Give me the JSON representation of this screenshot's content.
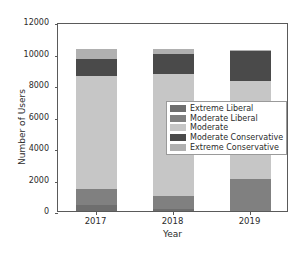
{
  "chart_data": {
    "type": "bar",
    "subtype": "stacked-vertical",
    "title": "",
    "xlabel": "Year",
    "ylabel": "Number of Users",
    "categories": [
      "2017",
      "2018",
      "2019"
    ],
    "xtick_labels": [
      "2017",
      "2018",
      "2019"
    ],
    "ytick_labels": [
      "0",
      "2000",
      "4000",
      "6000",
      "8000",
      "10000",
      "12000"
    ],
    "ytick_values": [
      0,
      2000,
      4000,
      6000,
      8000,
      10000,
      12000
    ],
    "ylim": [
      0,
      12000
    ],
    "grid": false,
    "legend_position": "center-right",
    "series": [
      {
        "name": "Extreme Liberal",
        "color": "#6e6e6e",
        "values": [
          400,
          100,
          0
        ]
      },
      {
        "name": "Moderate Liberal",
        "color": "#808080",
        "values": [
          1000,
          850,
          2050
        ]
      },
      {
        "name": "Moderate",
        "color": "#c6c6c6",
        "values": [
          7150,
          7750,
          6200
        ]
      },
      {
        "name": "Moderate Conservative",
        "color": "#4a4a4a",
        "values": [
          1100,
          1300,
          1900
        ]
      },
      {
        "name": "Extreme Conservative",
        "color": "#b0b0b0",
        "values": [
          650,
          300,
          100
        ]
      }
    ],
    "totals": [
      10300,
      10300,
      10250
    ]
  },
  "legend": {
    "items": [
      {
        "label": "Extreme Liberal",
        "color": "#6e6e6e"
      },
      {
        "label": "Moderate Liberal",
        "color": "#808080"
      },
      {
        "label": "Moderate",
        "color": "#c6c6c6"
      },
      {
        "label": "Moderate Conservative",
        "color": "#4a4a4a"
      },
      {
        "label": "Extreme Conservative",
        "color": "#b0b0b0"
      }
    ]
  },
  "axes": {
    "x_title": "Year",
    "y_title": "Number of Users"
  }
}
